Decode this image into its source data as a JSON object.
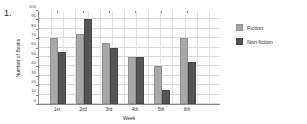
{
  "question_number": "1.",
  "chart_data": {
    "type": "bar",
    "title": "",
    "xlabel": "Week",
    "ylabel": "Number of Books",
    "categories": [
      "1st",
      "2nd",
      "3rd",
      "4th",
      "5th",
      "6th"
    ],
    "series": [
      {
        "name": "Fiction",
        "color": "#a8a8a8",
        "values": [
          70,
          75,
          65,
          50,
          40,
          70
        ]
      },
      {
        "name": "Non-fiction",
        "color": "#555555",
        "values": [
          55,
          90,
          60,
          50,
          15,
          45
        ]
      }
    ],
    "ylim": [
      0,
      100
    ],
    "yticks": [
      0,
      10,
      20,
      30,
      40,
      50,
      60,
      70,
      80,
      90,
      100
    ],
    "grid": true,
    "legend_position": "right"
  }
}
